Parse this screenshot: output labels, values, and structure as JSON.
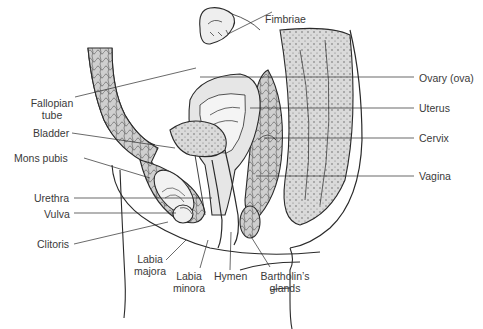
{
  "diagram": {
    "colors": {
      "line": "#2a2a2a",
      "fill": "#d4d4d4",
      "fill_light": "#e6e6e6",
      "label": "#3a3a3a"
    },
    "labels": {
      "fimbriae": "Fimbriae",
      "fallopian_tube_1": "Fallopian",
      "fallopian_tube_2": "tube",
      "bladder": "Bladder",
      "mons_pubis": "Mons pubis",
      "urethra": "Urethra",
      "vulva": "Vulva",
      "clitoris": "Clitoris",
      "labia_majora_1": "Labia",
      "labia_majora_2": "majora",
      "labia_minora_1": "Labia",
      "labia_minora_2": "minora",
      "hymen": "Hymen",
      "bartholins_1": "Bartholin’s",
      "bartholins_2": "glands",
      "ovary": "Ovary (ova)",
      "uterus": "Uterus",
      "cervix": "Cervix",
      "vagina": "Vagina"
    }
  }
}
